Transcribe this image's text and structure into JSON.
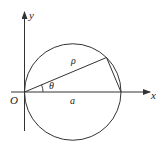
{
  "diagram": {
    "colors": {
      "stroke": "#333333",
      "text": "#222222",
      "background": "#ffffff"
    },
    "labels": {
      "y_axis": "y",
      "x_axis": "x",
      "origin": "O",
      "rho": "ρ",
      "theta": "θ",
      "diameter": "a"
    },
    "geometry": {
      "origin": [
        24.5,
        92
      ],
      "circle_center": [
        72.75,
        92
      ],
      "circle_radius": 48.25,
      "diameter_end": [
        121,
        92
      ],
      "point_on_circle": [
        106.5,
        57.5
      ],
      "theta_deg": 22.8
    }
  }
}
